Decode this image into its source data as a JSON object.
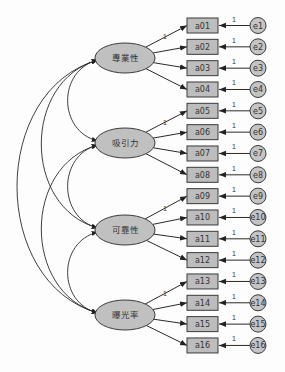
{
  "diagram": {
    "type": "structural-equation-model",
    "latent_variables": [
      {
        "id": "L1",
        "label": "專業性",
        "indicators": [
          "a01",
          "a02",
          "a03",
          "a04"
        ]
      },
      {
        "id": "L2",
        "label": "吸引力",
        "indicators": [
          "a05",
          "a06",
          "a07",
          "a08"
        ]
      },
      {
        "id": "L3",
        "label": "可靠性",
        "indicators": [
          "a09",
          "a10",
          "a11",
          "a12"
        ]
      },
      {
        "id": "L4",
        "label": "曝光率",
        "indicators": [
          "a13",
          "a14",
          "a15",
          "a16"
        ]
      }
    ],
    "observed_variables": [
      {
        "label": "a01",
        "error": "e1"
      },
      {
        "label": "a02",
        "error": "e2"
      },
      {
        "label": "a03",
        "error": "e3"
      },
      {
        "label": "a04",
        "error": "e4"
      },
      {
        "label": "a05",
        "error": "e5"
      },
      {
        "label": "a06",
        "error": "e6"
      },
      {
        "label": "a07",
        "error": "e7"
      },
      {
        "label": "a08",
        "error": "e8"
      },
      {
        "label": "a09",
        "error": "e9"
      },
      {
        "label": "a10",
        "error": "e10"
      },
      {
        "label": "a11",
        "error": "e11"
      },
      {
        "label": "a12",
        "error": "e12"
      },
      {
        "label": "a13",
        "error": "e13"
      },
      {
        "label": "a14",
        "error": "e14"
      },
      {
        "label": "a15",
        "error": "e15"
      },
      {
        "label": "a16",
        "error": "e16"
      }
    ],
    "fixed_loading_label": "1",
    "error_path_label": "1",
    "covariances": [
      [
        "L1",
        "L2"
      ],
      [
        "L1",
        "L3"
      ],
      [
        "L1",
        "L4"
      ],
      [
        "L2",
        "L3"
      ],
      [
        "L2",
        "L4"
      ],
      [
        "L3",
        "L4"
      ]
    ]
  }
}
